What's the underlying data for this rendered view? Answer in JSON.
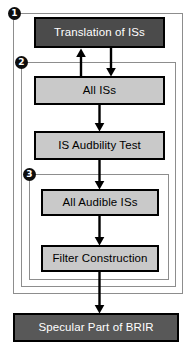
{
  "diagram": {
    "type": "flowchart",
    "width": 190,
    "height": 353,
    "colors": {
      "box_dark": "#4b4b4b",
      "box_mid": "#585858",
      "box_light": "#c9c9c9",
      "box_border": "#000000",
      "frame_border": "#8d8d8d",
      "marker_fill": "#0d0d0d",
      "marker_text": "#ffffff",
      "background": "#ffffff",
      "arrow": "#000000"
    }
  },
  "markers": [
    {
      "id": "marker-1",
      "label": "1"
    },
    {
      "id": "marker-2",
      "label": "2"
    },
    {
      "id": "marker-3",
      "label": "3"
    }
  ],
  "nodes": {
    "translation": {
      "label": "Translation of ISs",
      "style": "dark"
    },
    "all_iss": {
      "label": "All ISs",
      "style": "light"
    },
    "audibility": {
      "label": "IS Audbility Test",
      "style": "light"
    },
    "all_audible": {
      "label": "All Audible ISs",
      "style": "light"
    },
    "filter": {
      "label": "Filter Construction",
      "style": "light"
    },
    "specular": {
      "label": "Specular Part of BRIR",
      "style": "mid"
    }
  },
  "edges": [
    {
      "from": "translation",
      "to": "all_iss",
      "direction": "down"
    },
    {
      "from": "all_iss",
      "to": "translation",
      "direction": "up"
    },
    {
      "from": "all_iss",
      "to": "audibility",
      "direction": "down"
    },
    {
      "from": "audibility",
      "to": "all_audible",
      "direction": "down"
    },
    {
      "from": "all_audible",
      "to": "filter",
      "direction": "down"
    },
    {
      "from": "filter",
      "to": "specular",
      "direction": "down"
    }
  ],
  "groups": [
    {
      "id": "frame-1",
      "marker": "1"
    },
    {
      "id": "frame-2",
      "marker": "2"
    },
    {
      "id": "frame-3",
      "marker": "3"
    }
  ]
}
